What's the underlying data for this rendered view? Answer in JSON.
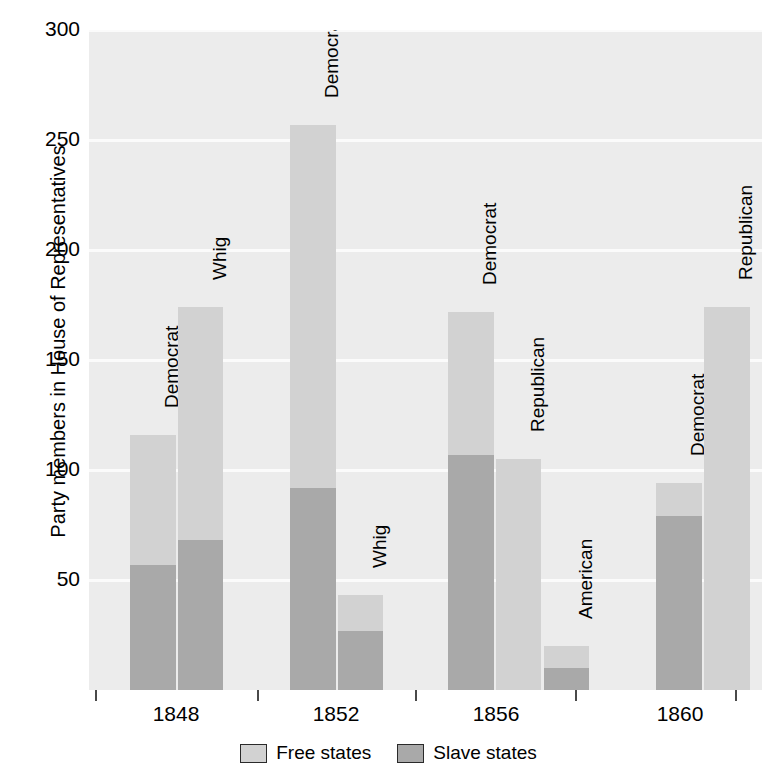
{
  "chart_data": {
    "type": "bar",
    "title": "",
    "subtitle": "",
    "xlabel": "",
    "ylabel": "Party members in House of Representatives",
    "ylim": [
      0,
      300
    ],
    "yticks": [
      50,
      100,
      150,
      200,
      250,
      300
    ],
    "ytick_labels": [
      "50",
      "100",
      "150",
      "200",
      "250",
      "300"
    ],
    "grid": true,
    "stacked": true,
    "legend_position": "bottom-center",
    "categories": [
      "1848",
      "1852",
      "1856",
      "1860"
    ],
    "series": [
      {
        "name": "Free states",
        "color": "#d2d2d2"
      },
      {
        "name": "Slave states",
        "color": "#a9a9a9"
      }
    ],
    "bars": [
      {
        "year": "1848",
        "party": "Democrat",
        "free": 59,
        "slave": 57,
        "total": 116
      },
      {
        "year": "1848",
        "party": "Whig",
        "free": 106,
        "slave": 68,
        "total": 174
      },
      {
        "year": "1852",
        "party": "Democrat",
        "free": 165,
        "slave": 92,
        "total": 257
      },
      {
        "year": "1852",
        "party": "Whig",
        "free": 16,
        "slave": 27,
        "total": 43
      },
      {
        "year": "1856",
        "party": "Democrat",
        "free": 65,
        "slave": 107,
        "total": 172
      },
      {
        "year": "1856",
        "party": "Republican",
        "free": 105,
        "slave": 0,
        "total": 105
      },
      {
        "year": "1856",
        "party": "American",
        "free": 10,
        "slave": 10,
        "total": 20
      },
      {
        "year": "1860",
        "party": "Democrat",
        "free": 15,
        "slave": 79,
        "total": 94
      },
      {
        "year": "1860",
        "party": "Republican",
        "free": 174,
        "slave": 0,
        "total": 174
      }
    ]
  },
  "axis": {
    "y_title": "Party members in House of Representatives",
    "y_labels": [
      "300",
      "250",
      "200",
      "150",
      "100",
      "50"
    ],
    "x_labels": [
      "1848",
      "1852",
      "1856",
      "1860"
    ]
  },
  "bar_labels": [
    "Democrat",
    "Whig",
    "Democrat",
    "Whig",
    "Democrat",
    "Republican",
    "American",
    "Democrat",
    "Republican"
  ],
  "legend": {
    "items": [
      {
        "label": "Free states",
        "color": "#d2d2d2"
      },
      {
        "label": "Slave states",
        "color": "#a9a9a9"
      }
    ]
  },
  "colors": {
    "free_states": "#d2d2d2",
    "slave_states": "#a9a9a9",
    "plot_background": "#ececec",
    "gridline": "#fbfbfb",
    "text": "#000000"
  }
}
